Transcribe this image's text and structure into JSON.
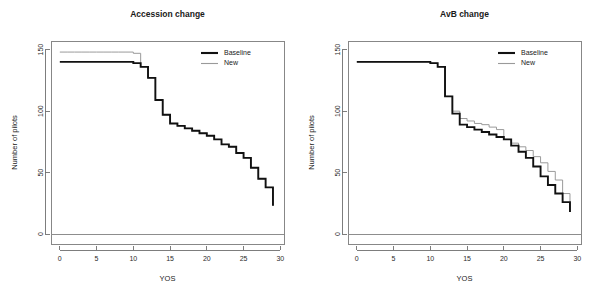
{
  "figure": {
    "background_color": "#ffffff",
    "panel_count": 2,
    "width": 594,
    "height": 306
  },
  "colors": {
    "baseline": "#111111",
    "new": "#9a9a9a",
    "axis": "#6f6f6f",
    "box": "#7a7a7a",
    "text": "#1a1a1a"
  },
  "legend": {
    "position": "top-right",
    "entries": [
      {
        "label": "Baseline",
        "color": "#111111",
        "width": "thick"
      },
      {
        "label": "New",
        "color": "#9a9a9a",
        "width": "thin"
      }
    ]
  },
  "axes": {
    "xlabel": "YOS",
    "ylabel": "Number of pilots",
    "xticks": [
      0,
      5,
      10,
      15,
      20,
      25,
      30
    ],
    "yticks": [
      0,
      50,
      100,
      150
    ],
    "xlim": [
      -1.2,
      30.5
    ],
    "ylim": [
      -8,
      157
    ]
  },
  "chart_data": [
    {
      "type": "line",
      "subtype": "step",
      "title": "Accession change",
      "xlabel": "YOS",
      "ylabel": "Number of pilots",
      "xlim": [
        -1.2,
        30.5
      ],
      "ylim": [
        -8,
        157
      ],
      "xticks": [
        0,
        5,
        10,
        15,
        20,
        25,
        30
      ],
      "yticks": [
        0,
        50,
        100,
        150
      ],
      "grid": false,
      "legend": [
        "Baseline",
        "New"
      ],
      "legend_position": "top-right",
      "annotations": [
        {
          "kind": "hline",
          "y": 0,
          "color": "#8d8d8d"
        }
      ],
      "x": [
        0,
        1,
        2,
        3,
        4,
        5,
        6,
        7,
        8,
        9,
        10,
        11,
        12,
        13,
        14,
        15,
        16,
        17,
        18,
        19,
        20,
        21,
        22,
        23,
        24,
        25,
        26,
        27,
        28,
        29
      ],
      "series": [
        {
          "name": "Baseline",
          "color": "#111111",
          "values": [
            140,
            140,
            140,
            140,
            140,
            140,
            140,
            140,
            140,
            140,
            139,
            136,
            127,
            109,
            97,
            90,
            88,
            86,
            84,
            82,
            80,
            77,
            73,
            71,
            66,
            62,
            54,
            45,
            38,
            23
          ]
        },
        {
          "name": "New",
          "color": "#9a9a9a",
          "values": [
            148,
            148,
            148,
            148,
            148,
            148,
            148,
            148,
            148,
            148,
            147,
            136,
            127,
            109,
            97,
            90,
            88,
            86,
            84,
            82,
            80,
            77,
            73,
            71,
            66,
            62,
            54,
            45,
            38,
            23
          ]
        }
      ]
    },
    {
      "type": "line",
      "subtype": "step",
      "title": "AvB change",
      "xlabel": "YOS",
      "ylabel": "Number of pilots",
      "xlim": [
        -1.2,
        30.5
      ],
      "ylim": [
        -8,
        157
      ],
      "xticks": [
        0,
        5,
        10,
        15,
        20,
        25,
        30
      ],
      "yticks": [
        0,
        50,
        100,
        150
      ],
      "grid": false,
      "legend": [
        "Baseline",
        "New"
      ],
      "legend_position": "top-right",
      "annotations": [
        {
          "kind": "hline",
          "y": 0,
          "color": "#8d8d8d"
        }
      ],
      "x": [
        0,
        1,
        2,
        3,
        4,
        5,
        6,
        7,
        8,
        9,
        10,
        11,
        12,
        13,
        14,
        15,
        16,
        17,
        18,
        19,
        20,
        21,
        22,
        23,
        24,
        25,
        26,
        27,
        28,
        29
      ],
      "series": [
        {
          "name": "Baseline",
          "color": "#111111",
          "values": [
            140,
            140,
            140,
            140,
            140,
            140,
            140,
            140,
            140,
            140,
            139,
            136,
            112,
            98,
            89,
            87,
            85,
            83,
            81,
            79,
            77,
            72,
            67,
            62,
            55,
            47,
            40,
            33,
            26,
            18
          ]
        },
        {
          "name": "New",
          "color": "#9a9a9a",
          "values": [
            140,
            140,
            140,
            140,
            140,
            140,
            140,
            140,
            140,
            140,
            139,
            136,
            112,
            100,
            94,
            92,
            90,
            89,
            87,
            85,
            77,
            74,
            71,
            68,
            63,
            58,
            51,
            44,
            33,
            18
          ]
        }
      ]
    }
  ]
}
